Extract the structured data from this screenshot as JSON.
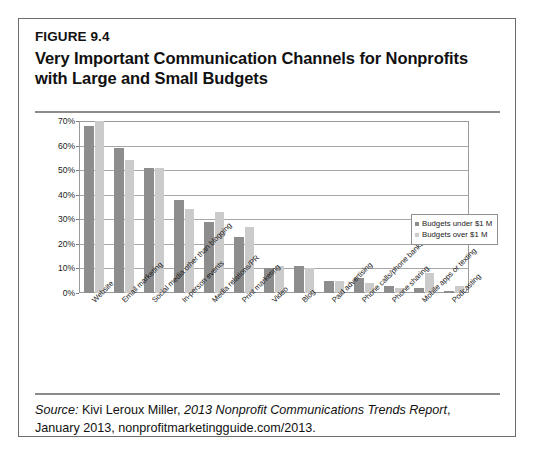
{
  "figure": {
    "number": "FIGURE 9.4",
    "title_line1": "Very Important Communication Channels for Nonprofits",
    "title_line2": "with Large and Small Budgets"
  },
  "source": {
    "label": "Source:",
    "author": " Kivi Leroux Miller, ",
    "report": "2013 Nonprofit Communications Trends Report",
    "tail": ", January 2013, nonprofitmarketingguide.com/2013."
  },
  "legend": {
    "position": "inside-right",
    "entries": [
      {
        "label": "Budgets under $1 M",
        "color": "#8d8d8d"
      },
      {
        "label": "Budgets over $1 M",
        "color": "#cbcbcb"
      }
    ]
  },
  "colors": {
    "series_under": "#8d8d8d",
    "series_over": "#cbcbcb",
    "gridline": "#a8a8a8",
    "frame": "#9a9a9a",
    "box_border": "#6d6d6d",
    "rule": "#8b8b8b",
    "text": "#111111"
  },
  "chart_data": {
    "type": "bar",
    "title": "Very Important Communication Channels for Nonprofits with Large and Small Budgets",
    "xlabel": "",
    "ylabel": "",
    "ylim": [
      0,
      70
    ],
    "yticks": [
      "0%",
      "10%",
      "20%",
      "30%",
      "40%",
      "50%",
      "60%",
      "70%"
    ],
    "ytick_values": [
      0,
      10,
      20,
      30,
      40,
      50,
      60,
      70
    ],
    "grid": true,
    "legend_position": "inside right",
    "categories": [
      "Website",
      "Email marketing",
      "Social media other than blogging",
      "In-person events",
      "Media relations/PR",
      "Print marketing",
      "Video",
      "Blog",
      "Paid advertising",
      "Phone calls/phone banks",
      "Phone sharing",
      "Mobile apps or texting",
      "Podcasting"
    ],
    "series": [
      {
        "name": "Budgets under $1 M",
        "color": "#8d8d8d",
        "values": [
          68,
          59,
          51,
          38,
          29,
          23,
          10,
          11,
          5,
          6,
          3,
          2,
          1
        ]
      },
      {
        "name": "Budgets over $1 M",
        "color": "#cbcbcb",
        "values": [
          70,
          54,
          51,
          34,
          33,
          27,
          11,
          10,
          5,
          4,
          2,
          8,
          3
        ]
      }
    ]
  }
}
